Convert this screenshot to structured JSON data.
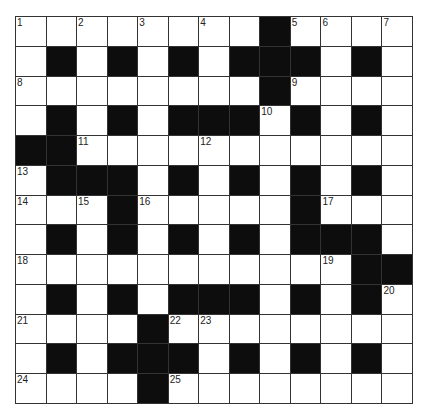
{
  "puzzle": {
    "rows": 13,
    "cols": 13,
    "grid": [
      "WWWWWWWWBWWWW",
      "WBWBWBWBBBWBW",
      "WWWWWWWWBWWWW",
      "WBWBWBBBWBWBW",
      "BBWWWWWWWWWWW",
      "WBBBWBWBWBWBW",
      "WWWBWWWWWBWWW",
      "WBWBWBWBWBBBW",
      "WWWWWWWWWWWBB",
      "WBWBWBBBWBWBW",
      "WWWWBWWWWWWWW",
      "WBWBBBWBWBWBW",
      "WWWWBWWWWWWWW"
    ],
    "numbers": [
      {
        "r": 0,
        "c": 0,
        "n": "1"
      },
      {
        "r": 0,
        "c": 2,
        "n": "2"
      },
      {
        "r": 0,
        "c": 4,
        "n": "3"
      },
      {
        "r": 0,
        "c": 6,
        "n": "4"
      },
      {
        "r": 0,
        "c": 9,
        "n": "5"
      },
      {
        "r": 0,
        "c": 10,
        "n": "6"
      },
      {
        "r": 0,
        "c": 12,
        "n": "7"
      },
      {
        "r": 2,
        "c": 0,
        "n": "8"
      },
      {
        "r": 2,
        "c": 9,
        "n": "9"
      },
      {
        "r": 3,
        "c": 8,
        "n": "10"
      },
      {
        "r": 4,
        "c": 2,
        "n": "11"
      },
      {
        "r": 4,
        "c": 6,
        "n": "12"
      },
      {
        "r": 5,
        "c": 0,
        "n": "13"
      },
      {
        "r": 6,
        "c": 0,
        "n": "14"
      },
      {
        "r": 6,
        "c": 2,
        "n": "15"
      },
      {
        "r": 6,
        "c": 4,
        "n": "16"
      },
      {
        "r": 6,
        "c": 10,
        "n": "17"
      },
      {
        "r": 8,
        "c": 0,
        "n": "18"
      },
      {
        "r": 8,
        "c": 10,
        "n": "19"
      },
      {
        "r": 9,
        "c": 12,
        "n": "20"
      },
      {
        "r": 10,
        "c": 0,
        "n": "21"
      },
      {
        "r": 10,
        "c": 5,
        "n": "22"
      },
      {
        "r": 10,
        "c": 6,
        "n": "23"
      },
      {
        "r": 12,
        "c": 0,
        "n": "24"
      },
      {
        "r": 12,
        "c": 5,
        "n": "25"
      }
    ]
  },
  "colors": {
    "black_cell": "#0d0d0d",
    "white_cell": "#ffffff",
    "grid_line": "#333333"
  }
}
